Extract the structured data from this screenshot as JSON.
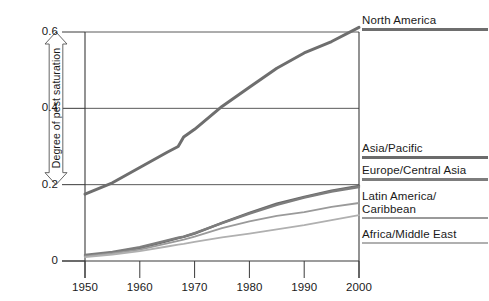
{
  "chart_data": {
    "type": "line",
    "title": "",
    "xlabel": "",
    "ylabel": "Degree of pest saturation",
    "x": [
      1950,
      1955,
      1960,
      1965,
      1967,
      1968,
      1970,
      1975,
      1980,
      1985,
      1990,
      1995,
      2000
    ],
    "xlim": [
      1950,
      2000
    ],
    "ylim": [
      0,
      0.62
    ],
    "xticks": [
      "1950",
      "1960",
      "1970",
      "1980",
      "1990",
      "2000"
    ],
    "yticks": [
      "0",
      "0.2",
      "0.4",
      "0.6"
    ],
    "ytick_values": [
      0,
      0.2,
      0.4,
      0.6
    ],
    "grid": "horizontal",
    "legend_position": "right-aligned-to-line-ends",
    "series": [
      {
        "name": "North America",
        "color": "#6e6e6e",
        "width": 3.0,
        "values": [
          0.175,
          0.205,
          0.245,
          0.285,
          0.3,
          0.325,
          0.345,
          0.405,
          0.455,
          0.505,
          0.545,
          0.575,
          0.612
        ]
      },
      {
        "name": "Asia/Pacific",
        "color": "#6b6b6b",
        "width": 2.4,
        "values": [
          0.013,
          0.022,
          0.034,
          0.052,
          0.06,
          0.063,
          0.072,
          0.1,
          0.126,
          0.15,
          0.168,
          0.184,
          0.197
        ]
      },
      {
        "name": "Europe/Central Asia",
        "color": "#7d7d7d",
        "width": 2.4,
        "values": [
          0.016,
          0.024,
          0.036,
          0.054,
          0.061,
          0.064,
          0.073,
          0.099,
          0.124,
          0.147,
          0.166,
          0.182,
          0.194
        ]
      },
      {
        "name": "Latin America/\nCaribbean",
        "color": "#9a9a9a",
        "width": 1.8,
        "values": [
          0.012,
          0.02,
          0.03,
          0.046,
          0.053,
          0.056,
          0.064,
          0.086,
          0.104,
          0.118,
          0.128,
          0.142,
          0.152
        ]
      },
      {
        "name": "Africa/Middle East",
        "color": "#b0b0b0",
        "width": 1.8,
        "values": [
          0.01,
          0.017,
          0.026,
          0.038,
          0.043,
          0.045,
          0.05,
          0.062,
          0.072,
          0.083,
          0.094,
          0.107,
          0.12
        ]
      }
    ]
  },
  "axis": {
    "y_title": "Degree of pest saturation",
    "y_ticks": [
      {
        "label": "0.6",
        "value": 0.6
      },
      {
        "label": "0.4",
        "value": 0.4
      },
      {
        "label": "0.2",
        "value": 0.2
      },
      {
        "label": "0",
        "value": 0
      }
    ],
    "x_ticks": [
      {
        "label": "1950",
        "value": 1950
      },
      {
        "label": "1960",
        "value": 1960
      },
      {
        "label": "1970",
        "value": 1970
      },
      {
        "label": "1980",
        "value": 1980
      },
      {
        "label": "1990",
        "value": 1990
      },
      {
        "label": "2000",
        "value": 2000
      }
    ]
  },
  "legend": {
    "entries": [
      {
        "label": "North America",
        "color": "#6e6e6e",
        "thickness": 3.2,
        "top": 14
      },
      {
        "label": "Asia/Pacific",
        "color": "#6b6b6b",
        "thickness": 2.8,
        "top": 142
      },
      {
        "label": "Europe/Central Asia",
        "color": "#7d7d7d",
        "thickness": 2.8,
        "top": 164
      },
      {
        "label": "Latin America/\nCaribbean",
        "color": "#9a9a9a",
        "thickness": 2.2,
        "top": 190
      },
      {
        "label": "Africa/Middle East",
        "color": "#b0b0b0",
        "thickness": 2.2,
        "top": 228
      }
    ]
  },
  "colors": {
    "axis": "#3a3a3a",
    "grid": "#5a5a5a",
    "text": "#1a1a1a",
    "background": "#ffffff"
  }
}
